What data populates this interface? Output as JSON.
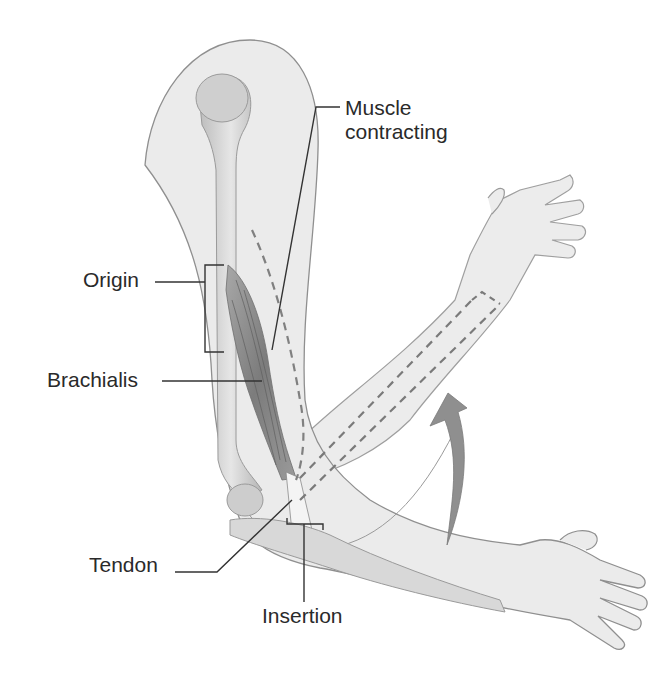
{
  "diagram": {
    "type": "anatomical-illustration",
    "labels": {
      "muscle_contracting_line1": "Muscle",
      "muscle_contracting_line2": "contracting",
      "origin": "Origin",
      "brachialis": "Brachialis",
      "tendon": "Tendon",
      "insertion": "Insertion"
    },
    "elements": [
      "upper-arm-silhouette",
      "humerus-bone",
      "brachialis-muscle",
      "forearm-lowered",
      "forearm-raised-dashed-bones",
      "flexion-arrow",
      "ulna-bone"
    ],
    "colors": {
      "skin_fill": "#e9e9e9",
      "outline": "#8a8a8a",
      "bone": "#cfcfcf",
      "muscle": "#8c8c8c",
      "arrow": "#8f8f8f",
      "dashes": "#7a7a7a",
      "leader_lines": "#333333"
    }
  }
}
